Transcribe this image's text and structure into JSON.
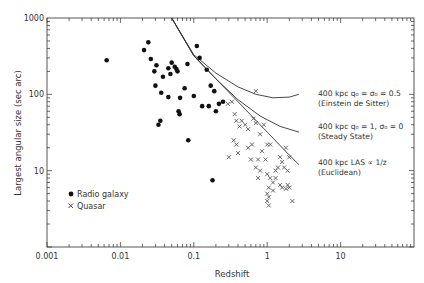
{
  "chart_data": {
    "type": "scatter",
    "title": "",
    "xlabel": "Redshift",
    "ylabel": "Largest angular size (sec arc)",
    "xscale": "log",
    "yscale": "log",
    "xlim": [
      0.001,
      100
    ],
    "ylim": [
      1,
      1000
    ],
    "x_ticks": [
      "0.001",
      "0.01",
      "0.1",
      "1",
      "10"
    ],
    "y_ticks": [
      "1000",
      "100",
      "10"
    ],
    "grid": false,
    "legend": {
      "position": "lower-left",
      "entries": [
        {
          "marker": "dot",
          "label": "Radio galaxy"
        },
        {
          "marker": "x",
          "label": "Quasar"
        }
      ]
    },
    "series": [
      {
        "name": "Radio galaxy",
        "marker": "dot",
        "points": [
          [
            0.0065,
            280
          ],
          [
            0.021,
            380
          ],
          [
            0.024,
            480
          ],
          [
            0.026,
            290
          ],
          [
            0.029,
            200
          ],
          [
            0.031,
            240
          ],
          [
            0.03,
            130
          ],
          [
            0.038,
            170
          ],
          [
            0.045,
            220
          ],
          [
            0.05,
            260
          ],
          [
            0.055,
            230
          ],
          [
            0.058,
            215
          ],
          [
            0.06,
            200
          ],
          [
            0.048,
            185
          ],
          [
            0.036,
            105
          ],
          [
            0.045,
            92
          ],
          [
            0.065,
            90
          ],
          [
            0.075,
            120
          ],
          [
            0.11,
            430
          ],
          [
            0.12,
            300
          ],
          [
            0.082,
            250
          ],
          [
            0.1,
            95
          ],
          [
            0.062,
            60
          ],
          [
            0.064,
            55
          ],
          [
            0.084,
            25
          ],
          [
            0.035,
            45
          ],
          [
            0.033,
            40
          ],
          [
            0.15,
            210
          ],
          [
            0.17,
            130
          ],
          [
            0.19,
            110
          ],
          [
            0.16,
            70
          ],
          [
            0.13,
            70
          ],
          [
            0.2,
            60
          ],
          [
            0.22,
            75
          ],
          [
            0.25,
            80
          ],
          [
            0.18,
            7.5
          ]
        ]
      },
      {
        "name": "Quasar",
        "marker": "x",
        "points": [
          [
            0.7,
            110
          ],
          [
            0.29,
            75
          ],
          [
            0.33,
            80
          ],
          [
            0.36,
            55
          ],
          [
            0.38,
            45
          ],
          [
            0.45,
            45
          ],
          [
            0.5,
            40
          ],
          [
            0.42,
            38
          ],
          [
            0.55,
            35
          ],
          [
            0.65,
            48
          ],
          [
            0.7,
            42
          ],
          [
            0.9,
            40
          ],
          [
            0.55,
            20
          ],
          [
            0.62,
            22
          ],
          [
            0.8,
            30
          ],
          [
            0.35,
            25
          ],
          [
            0.38,
            22
          ],
          [
            1.0,
            22
          ],
          [
            1.1,
            22
          ],
          [
            1.5,
            15
          ],
          [
            1.6,
            13
          ],
          [
            0.6,
            14
          ],
          [
            0.75,
            14
          ],
          [
            1.8,
            20
          ],
          [
            2.0,
            15
          ],
          [
            0.4,
            17
          ],
          [
            0.3,
            15
          ],
          [
            0.7,
            11
          ],
          [
            0.8,
            10
          ],
          [
            1.0,
            9
          ],
          [
            1.3,
            10
          ],
          [
            1.4,
            11
          ],
          [
            1.7,
            11
          ],
          [
            1.9,
            10
          ],
          [
            1.1,
            8
          ],
          [
            0.75,
            8
          ],
          [
            1.2,
            7
          ],
          [
            1.5,
            6.5
          ],
          [
            1.9,
            6.5
          ],
          [
            2.0,
            6
          ],
          [
            1.8,
            5.8
          ],
          [
            1.05,
            6
          ],
          [
            1.2,
            5.5
          ],
          [
            1.0,
            5
          ],
          [
            1.05,
            4.5
          ],
          [
            1.0,
            4
          ],
          [
            1.05,
            3.5
          ],
          [
            2.2,
            4
          ],
          [
            1.6,
            6
          ],
          [
            1.3,
            8
          ],
          [
            0.85,
            18
          ],
          [
            0.95,
            14
          ]
        ]
      }
    ],
    "curves": [
      {
        "name": "Einstein de Sitter",
        "label_line1": "400 kpc  q0 = σ0 = 0.5",
        "label_line2": "(Einstein de Sitter)",
        "points": [
          [
            0.05,
            1000
          ],
          [
            0.1,
            330
          ],
          [
            0.2,
            190
          ],
          [
            0.4,
            125
          ],
          [
            0.7,
            100
          ],
          [
            1.2,
            90
          ],
          [
            2.0,
            92
          ],
          [
            2.7,
            100
          ]
        ]
      },
      {
        "name": "Steady State",
        "label_line1": "400 kpc  q0 = 1, σ0 = 0",
        "label_line2": "(Steady State)",
        "points": [
          [
            0.05,
            1000
          ],
          [
            0.1,
            320
          ],
          [
            0.2,
            160
          ],
          [
            0.4,
            85
          ],
          [
            0.8,
            52
          ],
          [
            1.5,
            38
          ],
          [
            2.7,
            32
          ]
        ]
      },
      {
        "name": "Euclidean",
        "label_line1": "400 kpc  LAS ∝ 1/z",
        "label_line2": "(Euclidean)",
        "points": [
          [
            0.05,
            1000
          ],
          [
            0.1,
            320
          ],
          [
            0.2,
            160
          ],
          [
            0.5,
            64
          ],
          [
            1.0,
            32
          ],
          [
            2.0,
            16
          ],
          [
            2.7,
            12
          ]
        ]
      }
    ]
  },
  "labels": {
    "xlabel": "Redshift",
    "ylabel": "Largest angular size (sec arc)",
    "legend_galaxy": "Radio galaxy",
    "legend_quasar": "Quasar",
    "curve1_l1": "400 kpc  q₀ = σ₀ = 0.5",
    "curve1_l2": "(Einstein de Sitter)",
    "curve2_l1": "400 kpc  q₀ = 1, σ₀ = 0",
    "curve2_l2": "(Steady State)",
    "curve3_l1": "400 kpc  LAS ∝ 1/z",
    "curve3_l2": "(Euclidean)"
  }
}
